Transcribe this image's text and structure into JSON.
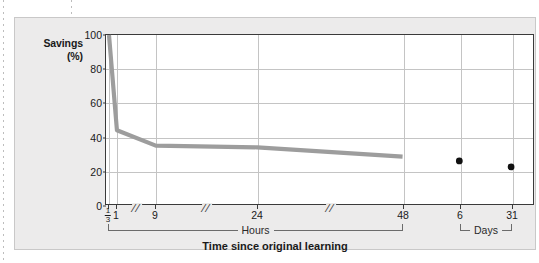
{
  "figure": {
    "x_axis_title": "Time since original learning"
  },
  "chart_data": {
    "type": "line",
    "title": "",
    "subtitle": "",
    "xlabel": "Time since original learning",
    "ylabel": "Savings (%)",
    "ylabel_lines": [
      "Savings",
      "(%)"
    ],
    "ylim": [
      0,
      100
    ],
    "y_ticks": [
      0,
      20,
      40,
      60,
      80,
      100
    ],
    "y_tick_labels": [
      "0",
      "20",
      "40",
      "60",
      "80",
      "100"
    ],
    "grid": "horizontal-and-vertical",
    "legend": "none",
    "x_scale_note": "broken categorical axis with // break marks",
    "x_ticks": [
      {
        "label": "1/3",
        "display": "fraction",
        "numerator": "1",
        "denominator": "3",
        "unit": "hours"
      },
      {
        "label": "1",
        "display": "plain",
        "unit": "hours"
      },
      {
        "label": "9",
        "display": "plain",
        "unit": "hours"
      },
      {
        "label": "24",
        "display": "plain",
        "unit": "hours"
      },
      {
        "label": "48",
        "display": "plain",
        "unit": "hours"
      },
      {
        "label": "6",
        "display": "plain",
        "unit": "days"
      },
      {
        "label": "31",
        "display": "plain",
        "unit": "days"
      }
    ],
    "axis_breaks": [
      "//",
      "//",
      "//"
    ],
    "groups": [
      {
        "label": "Hours",
        "from": "1/3",
        "to": "48"
      },
      {
        "label": "Days",
        "from": "6",
        "to": "31"
      }
    ],
    "series": [
      {
        "name": "Savings curve",
        "type": "line",
        "color": "#9d9d9d",
        "x": [
          "1/3",
          "1",
          "9",
          "24",
          "48"
        ],
        "values": [
          100,
          44,
          35,
          34,
          28.5
        ]
      },
      {
        "name": "Savings points",
        "type": "scatter",
        "color": "#111111",
        "x": [
          "6",
          "31"
        ],
        "values": [
          26,
          22.5
        ]
      }
    ]
  }
}
